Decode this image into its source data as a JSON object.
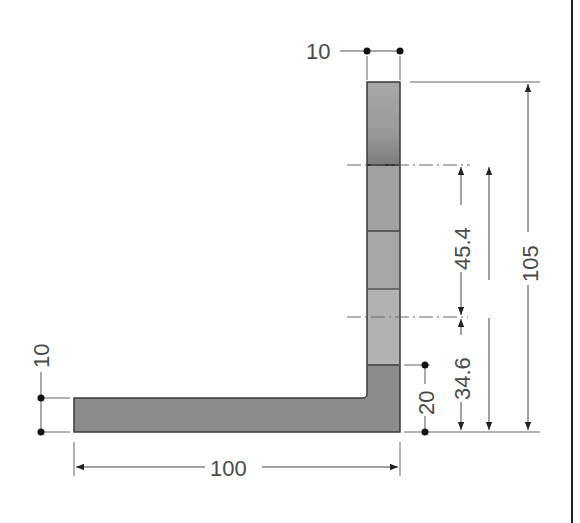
{
  "drawing": {
    "title": "L-profile cross-section with dimensions",
    "colors": {
      "shape_fill_dark": "#8c8c8c",
      "shape_fill_mid": "#a4a4a4",
      "shape_fill_light": "#b4b4b4",
      "outline": "#3a3a3a",
      "dim_line": "#555555",
      "text": "#4a4a4a",
      "border": "#222222"
    },
    "dimensions": {
      "vertical_leg_thickness": "10",
      "horizontal_leg_thickness": "10",
      "overall_width": "100",
      "overall_height": "105",
      "height_to_upper_axis": "80",
      "upper_segment": "45.4",
      "lower_segment": "34.6",
      "base_block": "20"
    }
  }
}
